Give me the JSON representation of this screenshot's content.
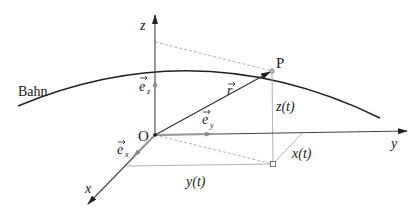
{
  "diagram": {
    "labels": {
      "trajectory": "Bahn",
      "origin": "O",
      "point": "P",
      "x_axis": "x",
      "y_axis": "y",
      "z_axis": "z",
      "position_vector": "r",
      "unit_x": "e",
      "unit_x_sub": "x",
      "unit_y": "e",
      "unit_y_sub": "y",
      "unit_z": "e",
      "unit_z_sub": "z",
      "x_component": "x(t)",
      "y_component": "y(t)",
      "z_component": "z(t)"
    },
    "colors": {
      "axis": "#444444",
      "curve": "#222222",
      "helper": "#999999",
      "text": "#1a1a1a"
    }
  }
}
